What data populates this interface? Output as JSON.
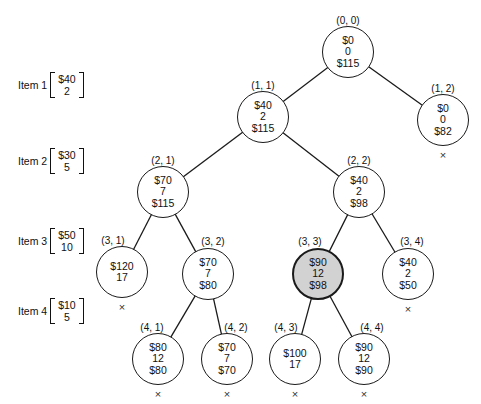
{
  "diagram": {
    "items": [
      {
        "name": "Item 1",
        "value": "$40",
        "weight": "2"
      },
      {
        "name": "Item 2",
        "value": "$30",
        "weight": "5"
      },
      {
        "name": "Item 3",
        "value": "$50",
        "weight": "10"
      },
      {
        "name": "Item 4",
        "value": "$10",
        "weight": "5"
      }
    ],
    "nodes": [
      {
        "id": "0-0",
        "label": "(0, 0)",
        "profit": "$0",
        "weight": "0",
        "bound": "$115",
        "x": 348,
        "y": 52,
        "r": 26,
        "shaded": false,
        "pruned": false,
        "label_x": 348,
        "label_y": 20
      },
      {
        "id": "1-1",
        "label": "(1, 1)",
        "profit": "$40",
        "weight": "2",
        "bound": "$115",
        "x": 263,
        "y": 117,
        "r": 26,
        "shaded": false,
        "pruned": false,
        "label_x": 263,
        "label_y": 85
      },
      {
        "id": "1-2",
        "label": "(1, 2)",
        "profit": "$0",
        "weight": "0",
        "bound": "$82",
        "x": 443,
        "y": 120,
        "r": 26,
        "shaded": false,
        "pruned": true,
        "label_x": 443,
        "label_y": 88
      },
      {
        "id": "2-1",
        "label": "(2, 1)",
        "profit": "$70",
        "weight": "7",
        "bound": "$115",
        "x": 163,
        "y": 192,
        "r": 26,
        "shaded": false,
        "pruned": false,
        "label_x": 163,
        "label_y": 160
      },
      {
        "id": "2-2",
        "label": "(2, 2)",
        "profit": "$40",
        "weight": "2",
        "bound": "$98",
        "x": 359,
        "y": 192,
        "r": 26,
        "shaded": false,
        "pruned": false,
        "label_x": 359,
        "label_y": 160
      },
      {
        "id": "3-1",
        "label": "(3, 1)",
        "profit": "$120",
        "weight": "17",
        "bound": "",
        "x": 122,
        "y": 272,
        "r": 26,
        "shaded": false,
        "pruned": true,
        "label_x": 113,
        "label_y": 240
      },
      {
        "id": "3-2",
        "label": "(3, 2)",
        "profit": "$70",
        "weight": "7",
        "bound": "$80",
        "x": 208,
        "y": 274,
        "r": 26,
        "shaded": false,
        "pruned": false,
        "label_x": 213,
        "label_y": 241
      },
      {
        "id": "3-3",
        "label": "(3, 3)",
        "profit": "$90",
        "weight": "12",
        "bound": "$98",
        "x": 318,
        "y": 274,
        "r": 26,
        "shaded": true,
        "pruned": false,
        "label_x": 310,
        "label_y": 241
      },
      {
        "id": "3-4",
        "label": "(3, 4)",
        "profit": "$40",
        "weight": "2",
        "bound": "$50",
        "x": 408,
        "y": 274,
        "r": 26,
        "shaded": false,
        "pruned": true,
        "label_x": 412,
        "label_y": 241
      },
      {
        "id": "4-1",
        "label": "(4, 1)",
        "profit": "$80",
        "weight": "12",
        "bound": "$80",
        "x": 158,
        "y": 359,
        "r": 26,
        "shaded": false,
        "pruned": true,
        "label_x": 152,
        "label_y": 327
      },
      {
        "id": "4-2",
        "label": "(4, 2)",
        "profit": "$70",
        "weight": "7",
        "bound": "$70",
        "x": 227,
        "y": 359,
        "r": 26,
        "shaded": false,
        "pruned": true,
        "label_x": 236,
        "label_y": 327
      },
      {
        "id": "4-3",
        "label": "(4, 3)",
        "profit": "$100",
        "weight": "17",
        "bound": "",
        "x": 295,
        "y": 359,
        "r": 26,
        "shaded": false,
        "pruned": true,
        "label_x": 286,
        "label_y": 327
      },
      {
        "id": "4-4",
        "label": "(4, 4)",
        "profit": "$90",
        "weight": "12",
        "bound": "$90",
        "x": 364,
        "y": 359,
        "r": 26,
        "shaded": false,
        "pruned": true,
        "label_x": 372,
        "label_y": 327
      }
    ],
    "edges": [
      {
        "from": "0-0",
        "to": "1-1"
      },
      {
        "from": "0-0",
        "to": "1-2"
      },
      {
        "from": "1-1",
        "to": "2-1"
      },
      {
        "from": "1-1",
        "to": "2-2"
      },
      {
        "from": "2-1",
        "to": "3-1"
      },
      {
        "from": "2-1",
        "to": "3-2"
      },
      {
        "from": "2-2",
        "to": "3-3"
      },
      {
        "from": "2-2",
        "to": "3-4"
      },
      {
        "from": "3-2",
        "to": "4-1"
      },
      {
        "from": "3-2",
        "to": "4-2"
      },
      {
        "from": "3-3",
        "to": "4-3"
      },
      {
        "from": "3-3",
        "to": "4-4"
      }
    ],
    "item_positions": [
      {
        "x": 18,
        "y": 72
      },
      {
        "x": 18,
        "y": 148
      },
      {
        "x": 18,
        "y": 228
      },
      {
        "x": 18,
        "y": 298
      }
    ],
    "cross_glyph": "×",
    "colors": {
      "stroke": "#1a1a1a",
      "node_fill": "#ffffff",
      "shaded_fill": "#d2d2d2",
      "text": "#111111",
      "background": "#ffffff"
    }
  }
}
